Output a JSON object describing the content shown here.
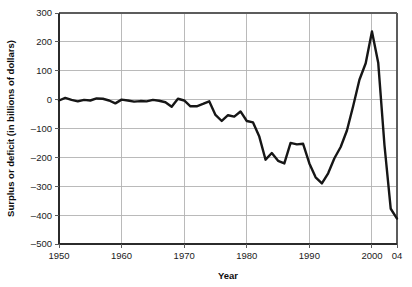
{
  "chart_data": {
    "type": "line",
    "title": "",
    "xlabel": "Year",
    "ylabel": "Surplus or deficit (in billions of dollars)",
    "xlim": [
      1950,
      2004
    ],
    "ylim": [
      -500,
      300
    ],
    "grid": true,
    "legend": false,
    "line_color": "#161616",
    "grid_color": "#b3b3b3",
    "axis_color": "#5c5c5c",
    "background_color": "#ffffff",
    "xticks": [
      1950,
      1960,
      1970,
      1980,
      1990,
      2000,
      2004
    ],
    "xticklabels": [
      "1950",
      "1960",
      "1970",
      "1980",
      "1990",
      "2000",
      "04"
    ],
    "yticks": [
      300,
      200,
      100,
      0,
      -100,
      -200,
      -300,
      -400,
      -500
    ],
    "yticklabels": [
      "300",
      "200",
      "100",
      "0",
      "-100",
      "-200",
      "-300",
      "-400",
      "-500"
    ],
    "series": [
      {
        "name": "Surplus or deficit",
        "x": [
          1950,
          1951,
          1952,
          1953,
          1954,
          1955,
          1956,
          1957,
          1958,
          1959,
          1960,
          1961,
          1962,
          1963,
          1964,
          1965,
          1966,
          1967,
          1968,
          1969,
          1970,
          1971,
          1972,
          1973,
          1974,
          1975,
          1976,
          1977,
          1978,
          1979,
          1980,
          1981,
          1982,
          1983,
          1984,
          1985,
          1986,
          1987,
          1988,
          1989,
          1990,
          1991,
          1992,
          1993,
          1994,
          1995,
          1996,
          1997,
          1998,
          1999,
          2000,
          2001,
          2002,
          2003,
          2004
        ],
        "values": [
          -3,
          6,
          -1,
          -6,
          -1,
          -3,
          4,
          3,
          -3,
          -13,
          0,
          -3,
          -7,
          -5,
          -6,
          -1,
          -4,
          -9,
          -25,
          3,
          -3,
          -23,
          -23,
          -15,
          -6,
          -53,
          -74,
          -54,
          -59,
          -41,
          -74,
          -79,
          -128,
          -208,
          -185,
          -212,
          -221,
          -150,
          -155,
          -153,
          -221,
          -269,
          -290,
          -255,
          -203,
          -164,
          -107,
          -22,
          69,
          126,
          236,
          128,
          -158,
          -378,
          -412
        ]
      }
    ]
  },
  "axis": {
    "y_label": "Surplus or deficit (in billions of dollars)",
    "x_label": "Year"
  }
}
